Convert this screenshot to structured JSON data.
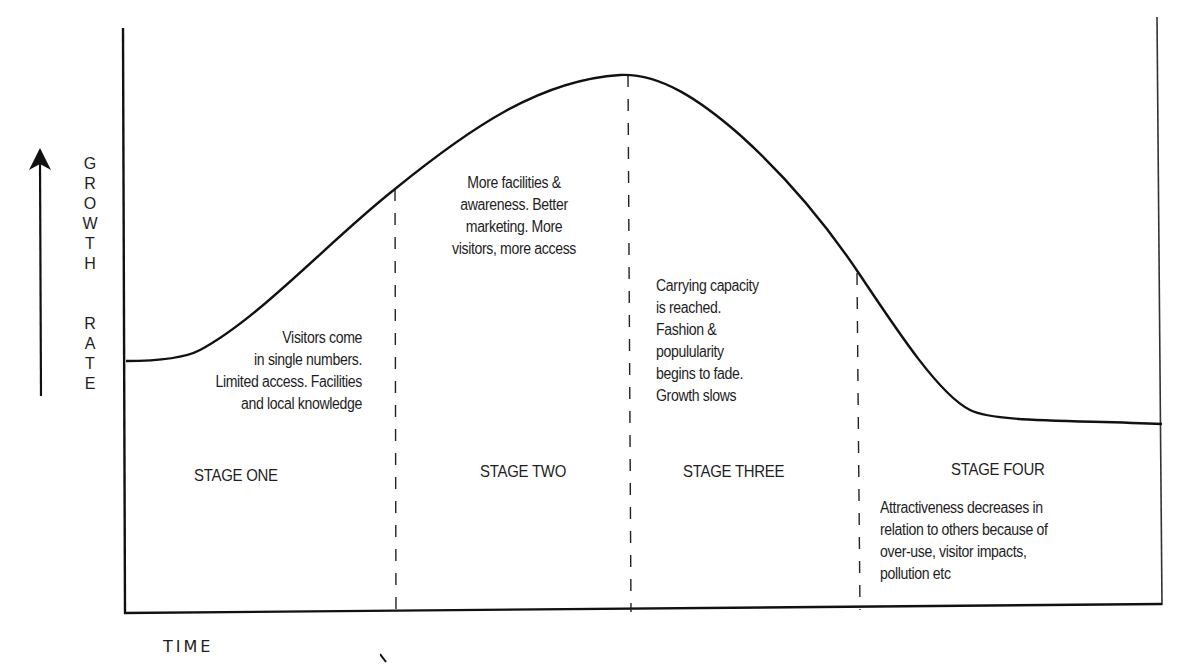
{
  "axes": {
    "y_label": "GROWTH RATE",
    "y_label_letters": [
      "G",
      "R",
      "O",
      "W",
      "T",
      "H",
      "",
      "R",
      "A",
      "T",
      "E"
    ],
    "x_label": "TIME"
  },
  "stages": [
    {
      "name": "STAGE ONE",
      "description": "Visitors come\nin single numbers.\nLimited access. Facilities\nand local knowledge"
    },
    {
      "name": "STAGE TWO",
      "description": "More facilities &\nawareness. Better\nmarketing. More\nvisitors, more access"
    },
    {
      "name": "STAGE THREE",
      "description": "Carrying capacity\nis reached.\nFashion &\npopulularity\nbegins to fade.\nGrowth slows"
    },
    {
      "name": "STAGE FOUR",
      "description": "Attractiveness decreases in\nrelation to others because of\nover-use, visitor impacts,\npollution etc"
    }
  ],
  "colors": {
    "line": "#111111",
    "background": "#ffffff"
  }
}
